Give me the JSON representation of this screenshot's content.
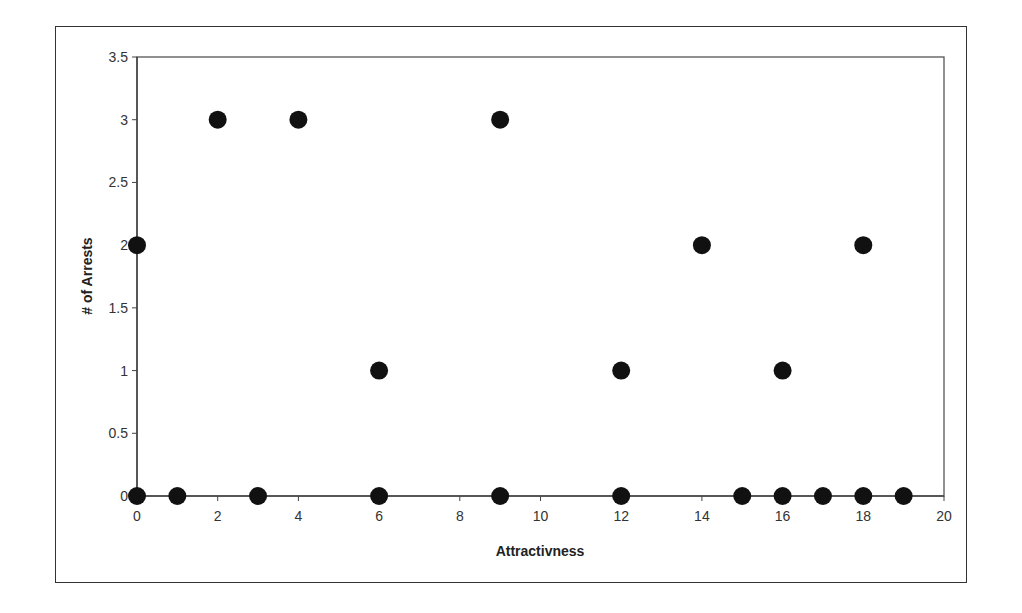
{
  "chart_data": {
    "type": "scatter",
    "title": "",
    "xlabel": "Attractivness",
    "ylabel": "# of Arrests",
    "xlim": [
      0,
      20
    ],
    "ylim": [
      0,
      3.5
    ],
    "x_ticks": [
      0,
      2,
      4,
      6,
      8,
      10,
      12,
      14,
      16,
      18,
      20
    ],
    "y_ticks": [
      0,
      0.5,
      1,
      1.5,
      2,
      2.5,
      3,
      3.5
    ],
    "grid": false,
    "legend": null,
    "marker_color": "#111111",
    "series": [
      {
        "name": "Arrests",
        "points": [
          {
            "x": 0,
            "y": 2
          },
          {
            "x": 0,
            "y": 0
          },
          {
            "x": 1,
            "y": 0
          },
          {
            "x": 2,
            "y": 3
          },
          {
            "x": 3,
            "y": 0
          },
          {
            "x": 4,
            "y": 3
          },
          {
            "x": 6,
            "y": 1
          },
          {
            "x": 6,
            "y": 0
          },
          {
            "x": 9,
            "y": 3
          },
          {
            "x": 9,
            "y": 0
          },
          {
            "x": 12,
            "y": 1
          },
          {
            "x": 12,
            "y": 0
          },
          {
            "x": 14,
            "y": 2
          },
          {
            "x": 15,
            "y": 0
          },
          {
            "x": 16,
            "y": 1
          },
          {
            "x": 16,
            "y": 0
          },
          {
            "x": 17,
            "y": 0
          },
          {
            "x": 18,
            "y": 2
          },
          {
            "x": 18,
            "y": 0
          },
          {
            "x": 19,
            "y": 0
          }
        ]
      }
    ]
  }
}
